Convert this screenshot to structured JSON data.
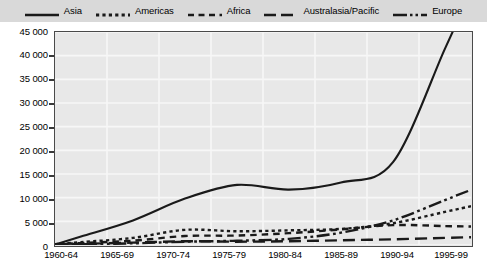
{
  "legend": {
    "position": "top",
    "items": [
      {
        "label": "Asia",
        "style": "solid",
        "icon": "line-solid-icon"
      },
      {
        "label": "Americas",
        "style": "dotted",
        "icon": "line-dotted-icon"
      },
      {
        "label": "Africa",
        "style": "dashed",
        "icon": "line-dashed-icon"
      },
      {
        "label": "Australasia/Pacific",
        "style": "long-dash",
        "icon": "line-long-dash-icon"
      },
      {
        "label": "Europe",
        "style": "dash-dot-dot",
        "icon": "line-dash-dot-icon"
      }
    ]
  },
  "axes": {
    "y_ticks": [
      "45 000",
      "40 000",
      "35 000",
      "30 000",
      "25 000",
      "20 000",
      "15 000",
      "10 000",
      "5 000",
      "0"
    ],
    "x_ticks": [
      "1960-64",
      "1965-69",
      "1970-74",
      "1975-79",
      "1980-84",
      "1985-89",
      "1990-94",
      "1995-99"
    ]
  },
  "colors": {
    "line": "#1a1a1a",
    "plot_background": "#e8e8e8",
    "legend_background": "#d9d9d9",
    "frame": "#4a4a4a",
    "gridline": "#f7f7f7"
  },
  "chart_data": {
    "type": "line",
    "title": "",
    "subtitle": "",
    "xlabel": "",
    "ylabel": "",
    "ylim": [
      0,
      45000
    ],
    "ytick_step": 5000,
    "grid": true,
    "legend_position": "top",
    "categories": [
      "1960-64",
      "1965-69",
      "1970-74",
      "1975-79",
      "1980-84",
      "1985-89",
      "1990-94",
      "1995-99"
    ],
    "series": [
      {
        "name": "Asia",
        "style": "solid",
        "values": [
          1800,
          5200,
          9800,
          12700,
          11700,
          13200,
          17500,
          41500
        ],
        "note": "peaks near 42 000 around 1990-94 then eases slightly to about 41 500"
      },
      {
        "name": "Americas",
        "style": "dotted",
        "values": [
          600,
          1500,
          3200,
          2900,
          3100,
          3400,
          4600,
          7000
        ]
      },
      {
        "name": "Africa",
        "style": "dashed",
        "values": [
          400,
          900,
          1900,
          2000,
          2500,
          3300,
          4200,
          4000
        ]
      },
      {
        "name": "Australasia/Pacific",
        "style": "long-dash",
        "values": [
          250,
          500,
          800,
          700,
          800,
          1000,
          1200,
          1500
        ]
      },
      {
        "name": "Europe",
        "style": "dash-dot-dot",
        "values": [
          150,
          350,
          700,
          900,
          1300,
          2600,
          5200,
          9500
        ]
      }
    ]
  }
}
